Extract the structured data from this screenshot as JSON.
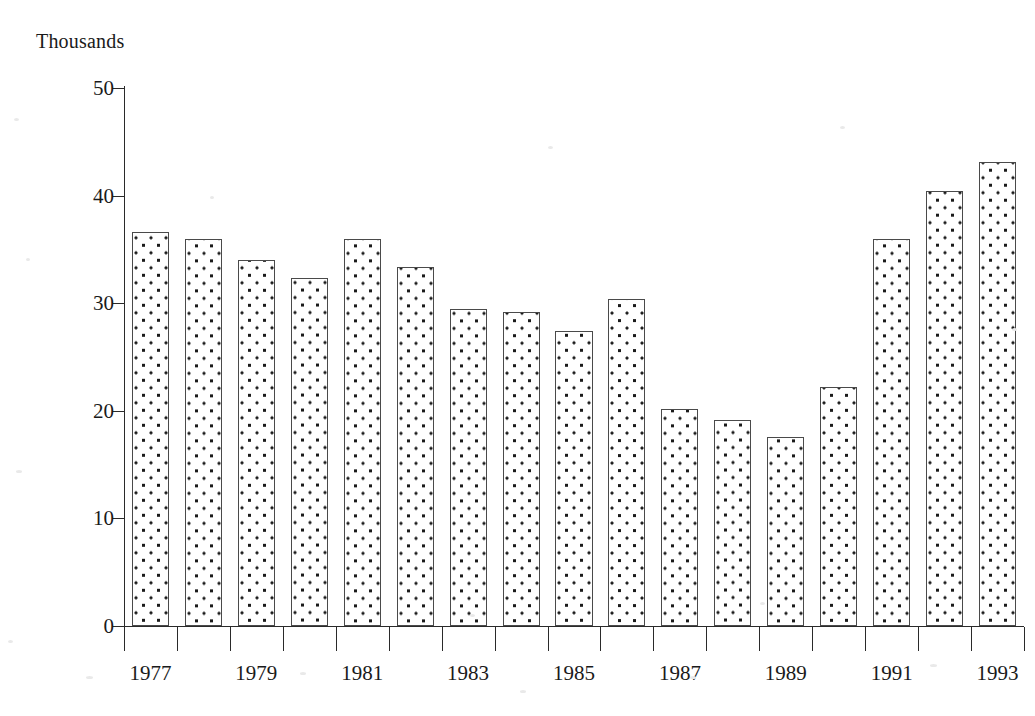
{
  "chart_data": {
    "type": "bar",
    "title": "",
    "subtitle": "",
    "xlabel": "",
    "ylabel": "Thousands",
    "ylim": [
      0,
      50
    ],
    "ytick_values": [
      0,
      10,
      20,
      30,
      40,
      50
    ],
    "ytick_labels": [
      "0",
      "10",
      "20",
      "30",
      "40",
      "50"
    ],
    "grid": false,
    "legend": null,
    "categories": [
      "1977",
      "1978",
      "1979",
      "1980",
      "1981",
      "1982",
      "1983",
      "1984",
      "1985",
      "1986",
      "1987",
      "1988",
      "1989",
      "1990",
      "1991",
      "1992",
      "1993"
    ],
    "xtick_labels_shown": [
      "1977",
      "1979",
      "1981",
      "1983",
      "1985",
      "1987",
      "1989",
      "1991",
      "1993"
    ],
    "values": [
      36.6,
      36.0,
      34.0,
      32.3,
      36.0,
      33.4,
      29.5,
      29.2,
      27.4,
      30.4,
      20.2,
      19.1,
      17.6,
      22.2,
      36.0,
      40.4,
      43.1
    ],
    "bar_fill_pattern": "dotted-stipple",
    "bar_edge_color": "#4a4a4a",
    "bar_fill_color": "#ffffff",
    "axis_color": "#2a2a2a",
    "background_color": "#ffffff"
  },
  "axis_caption": {
    "text": "Thousands"
  }
}
